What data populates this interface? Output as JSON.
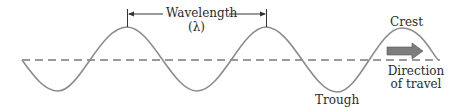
{
  "diagram": {
    "type": "transverse-wave",
    "labels": {
      "wavelength": "Wavelength",
      "lambda": "(λ)",
      "crest": "Crest",
      "trough": "Trough",
      "direction_line1": "Direction",
      "direction_line2": "of travel"
    },
    "colors": {
      "wave": "#8c8c8c",
      "baseline": "#7a7a7a",
      "arrow": "#7d7d7d",
      "text": "#2a2a2a"
    }
  }
}
